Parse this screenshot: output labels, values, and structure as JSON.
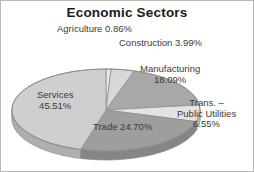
{
  "chart": {
    "title": "Economic Sectors"
  },
  "labels": {
    "agriculture": "Agriculture 0.86%",
    "construction": "Construction 3.99%",
    "manufacturing_name": "Manufacturing",
    "manufacturing_value": "18.09%",
    "transport_line1": "Trans. –",
    "transport_line2": "Public Utilities",
    "transport_value": "6.55%",
    "services_name": "Services",
    "services_value": "45.51%",
    "trade": "Trade 24.70%"
  },
  "chart_data": {
    "type": "pie",
    "title": "Economic Sectors",
    "xlabel": "",
    "ylabel": "",
    "categories": [
      "Agriculture",
      "Construction",
      "Manufacturing",
      "Trans. – Public Utilities",
      "Trade",
      "Services"
    ],
    "values": [
      0.86,
      3.99,
      18.09,
      6.55,
      24.7,
      45.51
    ],
    "value_labels": [
      "0.86%",
      "3.99%",
      "18.09%",
      "6.55%",
      "24.70%",
      "45.51%"
    ],
    "units": "percent",
    "total": 99.7,
    "legend": "none",
    "grid": false,
    "three_d": true,
    "start_angle_deg": -90,
    "direction": "clockwise",
    "slice_colors": [
      "#e8e8e8",
      "#d8d8d8",
      "#a8a8a8",
      "#e3e3e3",
      "#9e9e9e",
      "#cfcfcf"
    ]
  }
}
